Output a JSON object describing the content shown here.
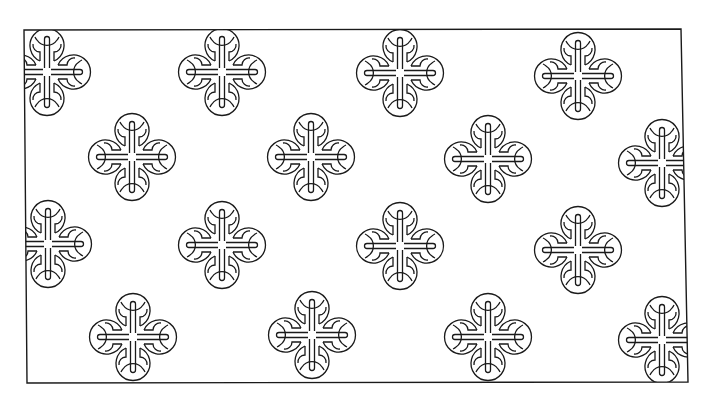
{
  "image": {
    "description": "Black line-art ornamental pattern of four-lobed knot motifs inside a slightly skewed rectangular frame",
    "background": "#ffffff",
    "stroke": "#1a1a1a",
    "frame": {
      "points": [
        [
          24,
          30
        ],
        [
          681,
          29
        ],
        [
          688,
          382
        ],
        [
          27,
          383
        ]
      ]
    },
    "motif": {
      "name": "four-lobed-knot",
      "lobe_radius": 17,
      "lobe_offset": 26
    },
    "motifs": [
      {
        "cx": 47,
        "cy": 72
      },
      {
        "cx": 222,
        "cy": 72
      },
      {
        "cx": 400,
        "cy": 73
      },
      {
        "cx": 578,
        "cy": 76
      },
      {
        "cx": 132,
        "cy": 157
      },
      {
        "cx": 311,
        "cy": 157
      },
      {
        "cx": 488,
        "cy": 159
      },
      {
        "cx": 662,
        "cy": 163
      },
      {
        "cx": 48,
        "cy": 244
      },
      {
        "cx": 222,
        "cy": 245
      },
      {
        "cx": 400,
        "cy": 246
      },
      {
        "cx": 578,
        "cy": 250
      },
      {
        "cx": 133,
        "cy": 337
      },
      {
        "cx": 312,
        "cy": 335
      },
      {
        "cx": 488,
        "cy": 337
      },
      {
        "cx": 662,
        "cy": 340
      }
    ]
  }
}
